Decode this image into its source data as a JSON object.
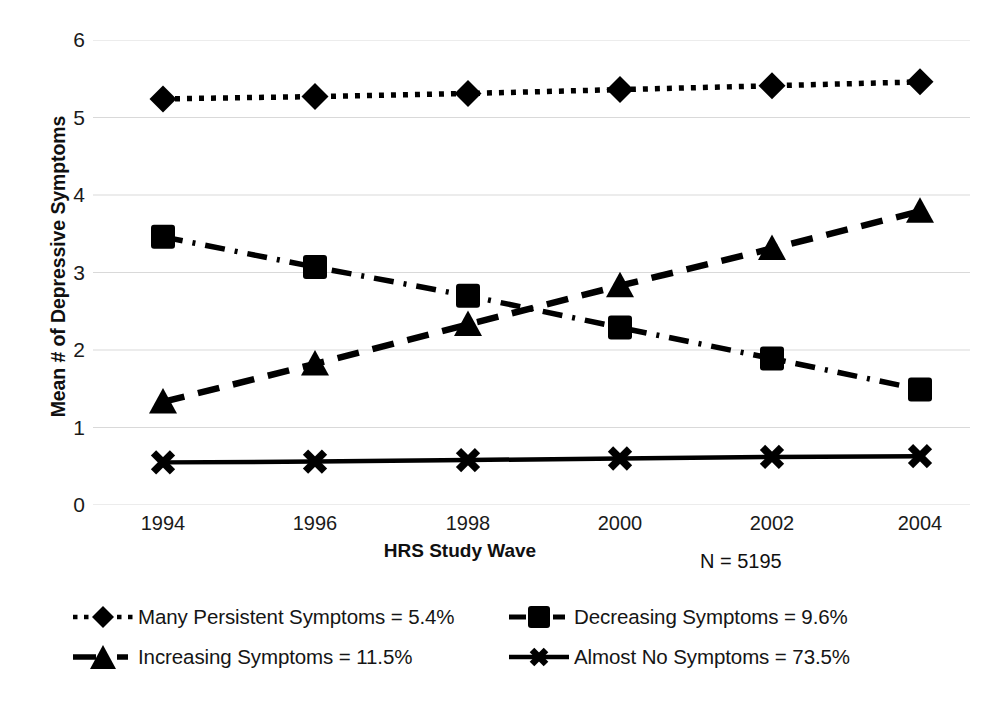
{
  "chart_data": {
    "type": "line",
    "title": "",
    "xlabel": "HRS Study Wave",
    "ylabel": "Mean # of Depressive Symptoms",
    "categories": [
      "1994",
      "1996",
      "1998",
      "2000",
      "2002",
      "2004"
    ],
    "ylim": [
      0,
      6
    ],
    "yticks": [
      "0",
      "1",
      "2",
      "3",
      "4",
      "5",
      "6"
    ],
    "grid": true,
    "legend_position": "bottom",
    "annotation": "N = 5195",
    "series": [
      {
        "name": "Many Persistent Symptoms = 5.4%",
        "short_name": "Many Persistent Symptoms",
        "percent": "5.4%",
        "marker": "diamond",
        "line_style": "dotted",
        "color": "#000000",
        "values": [
          5.24,
          5.27,
          5.31,
          5.36,
          5.41,
          5.46
        ]
      },
      {
        "name": "Decreasing Symptoms = 9.6%",
        "short_name": "Decreasing Symptoms",
        "percent": "9.6%",
        "marker": "square",
        "line_style": "dash-dot",
        "color": "#000000",
        "values": [
          3.46,
          3.07,
          2.7,
          2.29,
          1.89,
          1.49
        ]
      },
      {
        "name": "Increasing Symptoms = 11.5%",
        "short_name": "Increasing Symptoms",
        "percent": "11.5%",
        "marker": "triangle",
        "line_style": "dashed",
        "color": "#000000",
        "values": [
          1.33,
          1.82,
          2.33,
          2.83,
          3.31,
          3.79
        ]
      },
      {
        "name": "Almost No Symptoms = 73.5%",
        "short_name": "Almost No Symptoms",
        "percent": "73.5%",
        "marker": "cross",
        "line_style": "solid",
        "color": "#000000",
        "values": [
          0.55,
          0.56,
          0.58,
          0.6,
          0.62,
          0.63
        ]
      }
    ]
  },
  "axis": {
    "y_title": "Mean # of Depressive Symptoms",
    "x_title": "HRS Study Wave",
    "n_note": "N = 5195"
  },
  "legend": {
    "items": [
      {
        "label": "Many Persistent Symptoms = 5.4%",
        "key": "diamond-dotted-key"
      },
      {
        "label": "Increasing Symptoms = 11.5%",
        "key": "triangle-dashed-key"
      },
      {
        "label": "Decreasing Symptoms = 9.6%",
        "key": "square-dashdot-key"
      },
      {
        "label": "Almost No Symptoms = 73.5%",
        "key": "cross-solid-key"
      }
    ]
  },
  "colors": {
    "ink": "#000000",
    "grid": "#d9d9d9",
    "background": "#ffffff"
  }
}
